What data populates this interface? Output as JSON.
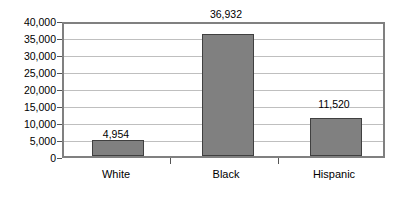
{
  "chart_data": {
    "type": "bar",
    "title": "",
    "subtitle": "",
    "xlabel": "",
    "ylabel": "",
    "categories": [
      "White",
      "Black",
      "Hispanic"
    ],
    "values": [
      4954,
      36932,
      11520
    ],
    "data_labels": [
      "4,954",
      "36,932",
      "11,520"
    ],
    "ylim": [
      0,
      40000
    ],
    "ytick_values": [
      0,
      5000,
      10000,
      15000,
      20000,
      25000,
      30000,
      35000,
      40000
    ],
    "ytick_labels": [
      "0",
      "5,000",
      "10,000",
      "15,000",
      "20,000",
      "25,000",
      "30,000",
      "35,000",
      "40,000"
    ],
    "grid": true,
    "grid_axis": "y",
    "legend": false,
    "legend_position": "none",
    "orientation": "vertical"
  },
  "style": {
    "bar_fill": "#808080",
    "bar_border": "#404040",
    "gridline_color": "#bfbfbf",
    "plot_border_color": "#808080",
    "background": "#ffffff",
    "text_color": "#000000"
  }
}
